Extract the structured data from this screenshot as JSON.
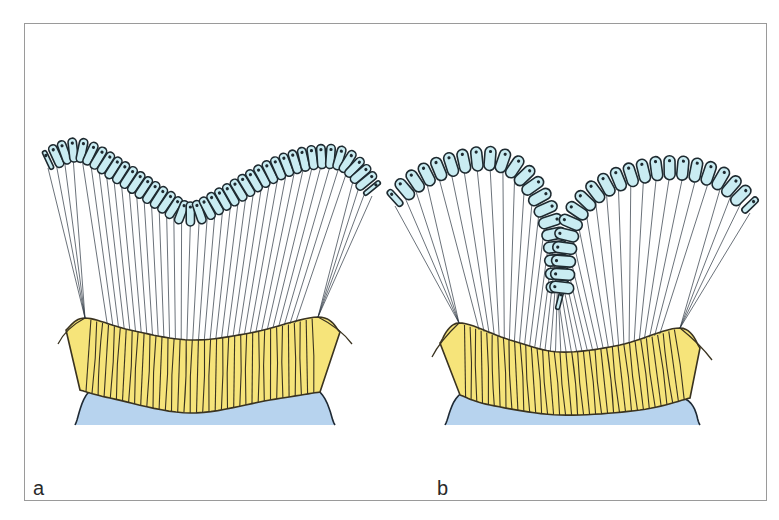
{
  "figure": {
    "type": "diagram",
    "colors": {
      "frame_border": "#9a9a9a",
      "cell_fill": "#c9ecf2",
      "cell_outline": "#1e2a30",
      "nucleus": "#1e2a30",
      "fiber": "#2b3540",
      "band_fill": "#f6e47a",
      "band_stripe": "#3a3320",
      "base_fill": "#b7d3ee",
      "base_outline": "#1f2a35"
    },
    "panels": [
      {
        "id": "a",
        "label": "a",
        "cell_count": 42,
        "cell_path": [
          [
            48,
            160
          ],
          [
            80,
            150
          ],
          [
            120,
            172
          ],
          [
            160,
            198
          ],
          [
            190,
            214
          ],
          [
            225,
            198
          ],
          [
            270,
            172
          ],
          [
            310,
            158
          ],
          [
            345,
            160
          ],
          [
            372,
            188
          ]
        ],
        "anchor_left": [
          85,
          318
        ],
        "anchor_right": [
          318,
          317
        ],
        "split_index": 18,
        "band_top": [
          [
            66,
            330
          ],
          [
            85,
            318
          ],
          [
            130,
            330
          ],
          [
            190,
            340
          ],
          [
            250,
            333
          ],
          [
            318,
            317
          ],
          [
            340,
            332
          ]
        ],
        "band_bottom": [
          [
            80,
            390
          ],
          [
            110,
            398
          ],
          [
            190,
            413
          ],
          [
            270,
            400
          ],
          [
            320,
            392
          ]
        ],
        "base": [
          [
            75,
            425
          ],
          [
            100,
            386
          ],
          [
            190,
            412
          ],
          [
            305,
            385
          ],
          [
            335,
            425
          ]
        ]
      },
      {
        "id": "b",
        "label": "b",
        "cell_count": 44,
        "cell_path": [
          [
            395,
            198
          ],
          [
            420,
            178
          ],
          [
            460,
            162
          ],
          [
            500,
            160
          ],
          [
            530,
            182
          ],
          [
            553,
            230
          ],
          [
            560,
            300
          ],
          [
            568,
            230
          ],
          [
            595,
            192
          ],
          [
            640,
            172
          ],
          [
            680,
            168
          ],
          [
            720,
            178
          ],
          [
            750,
            205
          ]
        ],
        "anchor_left": [
          459,
          323
        ],
        "anchor_right": [
          680,
          328
        ],
        "split_index": 22,
        "band_top": [
          [
            440,
            343
          ],
          [
            459,
            323
          ],
          [
            510,
            340
          ],
          [
            560,
            352
          ],
          [
            620,
            345
          ],
          [
            680,
            328
          ],
          [
            700,
            348
          ]
        ],
        "band_bottom": [
          [
            460,
            395
          ],
          [
            490,
            405
          ],
          [
            560,
            415
          ],
          [
            640,
            410
          ],
          [
            690,
            398
          ]
        ],
        "base": [
          [
            445,
            425
          ],
          [
            470,
            390
          ],
          [
            560,
            413
          ],
          [
            675,
            396
          ],
          [
            700,
            425
          ]
        ]
      }
    ]
  },
  "labels": {
    "a": "a",
    "b": "b"
  }
}
